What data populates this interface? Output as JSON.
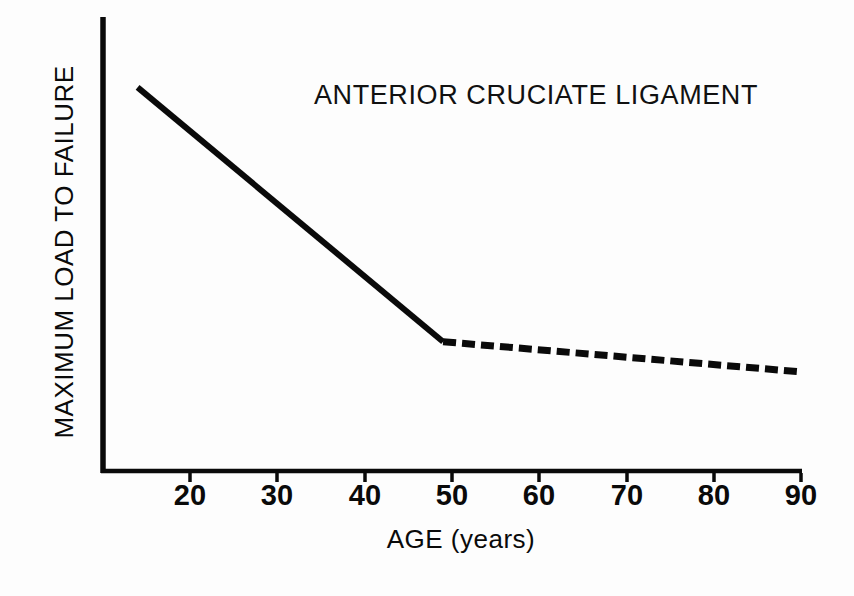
{
  "chart_data": {
    "type": "line",
    "title": "ANTERIOR CRUCIATE LIGAMENT",
    "xlabel": "AGE (years)",
    "ylabel": "MAXIMUM LOAD TO FAILURE",
    "xlim": [
      12,
      90
    ],
    "ylim": [
      0,
      100
    ],
    "xticks": [
      20,
      30,
      40,
      50,
      60,
      70,
      80,
      90
    ],
    "xtick_labels": [
      "20",
      "30",
      "40",
      "50",
      "60",
      "70",
      "80",
      "90"
    ],
    "yticks": [],
    "ytick_labels": [],
    "grid": false,
    "legend": null,
    "axis_spines": [
      "left",
      "bottom"
    ],
    "series": [
      {
        "name": "Maximum load to failure (measured)",
        "style": "solid",
        "color": "#0a0a0a",
        "linewidth": 6,
        "x": [
          14,
          49
        ],
        "values": [
          89,
          30
        ]
      },
      {
        "name": "Maximum load to failure (extrapolated)",
        "style": "dashed",
        "color": "#0a0a0a",
        "linewidth": 7,
        "dash_pattern": "13 6",
        "x": [
          49,
          90
        ],
        "values": [
          30,
          23
        ]
      }
    ],
    "annotations": []
  },
  "figure": {
    "background_color": "#fdfdfd",
    "foreground_color": "#0a0a0a"
  }
}
